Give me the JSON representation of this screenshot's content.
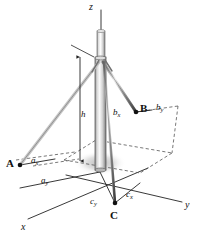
{
  "figure": {
    "kind": "technical-diagram",
    "background_color": "#ffffff",
    "line_color": "#222222",
    "dashed_color": "#555555",
    "mast_fill_light": "#f2f2f2",
    "mast_fill_dark": "#9a9a9a",
    "shadow_color": "#cccccc"
  },
  "axes": [
    {
      "id": "z",
      "label": "z",
      "x": 89,
      "y": 2
    },
    {
      "id": "y",
      "label": "y",
      "x": 185,
      "y": 200
    },
    {
      "id": "x",
      "label": "x",
      "x": 21,
      "y": 222
    }
  ],
  "points": [
    {
      "id": "A",
      "label": "A",
      "x": 6,
      "y": 158,
      "dot_x": 20,
      "dot_y": 165
    },
    {
      "id": "B",
      "label": "B",
      "x": 140,
      "y": 103,
      "dot_x": 136,
      "dot_y": 112
    },
    {
      "id": "C",
      "label": "C",
      "x": 110,
      "y": 212,
      "dot_x": 115,
      "dot_y": 203
    }
  ],
  "dimensions": [
    {
      "id": "h",
      "base": "h",
      "sub": "",
      "x": 81,
      "y": 110
    },
    {
      "id": "ax",
      "base": "a",
      "sub": "x",
      "x": 31,
      "y": 158
    },
    {
      "id": "ay",
      "base": "a",
      "sub": "y",
      "x": 41,
      "y": 178
    },
    {
      "id": "bx",
      "base": "b",
      "sub": "x",
      "x": 114,
      "y": 110
    },
    {
      "id": "by",
      "base": "b",
      "sub": "y",
      "x": 157,
      "y": 104
    },
    {
      "id": "cx",
      "base": "c",
      "sub": "x",
      "x": 126,
      "y": 193
    },
    {
      "id": "cy",
      "base": "c",
      "sub": "y",
      "x": 92,
      "y": 200
    }
  ]
}
